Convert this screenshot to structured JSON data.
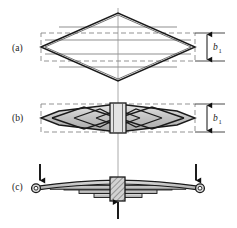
{
  "figure": {
    "width": 237,
    "height": 228,
    "background_color": "#ffffff",
    "stroke_color": "#1a1a1a",
    "cut_line_color": "#8a8a8a",
    "dashed_color": "#808080",
    "centerline_color": "#9a9a9a",
    "leaf_fill_color": "#c9c9c9",
    "clamp_fill_color": "#bdbdbd"
  },
  "panels": [
    {
      "id": "a",
      "label": "(a)",
      "label_x": 12,
      "label_y": 51,
      "description": "Diamond (lozenge) plate of maximum width b1 at the centre, divided by horizontal cut lines into strips",
      "dimension": {
        "symbol": "b",
        "subscript": "1",
        "label_x": 221,
        "label_y": 51
      },
      "diamond": {
        "center_x": 118,
        "center_y": 47,
        "half_length": 77,
        "half_height": 34
      },
      "cut_line_offsets": [
        -20,
        -7,
        7,
        20
      ],
      "dashed_box": {
        "x": 41,
        "y": 33,
        "width": 154,
        "height": 28
      }
    },
    {
      "id": "b",
      "label": "(b)",
      "label_x": 12,
      "label_y": 121,
      "description": "Strips rearranged symmetrically about the centre to form nested chevron leaves, held by a central clamp",
      "dimension": {
        "symbol": "b",
        "subscript": "1",
        "label_x": 221,
        "label_y": 121
      },
      "band": {
        "center_x": 118,
        "center_y": 118,
        "half_length": 77,
        "half_height": 14
      },
      "chevron_count": 3,
      "dashed_box": {
        "x": 41,
        "y": 104,
        "width": 154,
        "height": 28
      },
      "clamp": {
        "x": 110,
        "y": 104,
        "width": 16,
        "height": 29
      }
    },
    {
      "id": "c",
      "label": "(c)",
      "label_x": 12,
      "label_y": 188,
      "description": "Assembled semi-elliptic multi-leaf spring with rolled eyes at both ends, loaded at the eyes and supported at the centre clamp",
      "leaf_count": 5,
      "main_leaf": {
        "left_eye_x": 36,
        "right_eye_x": 200,
        "eye_y": 186,
        "eye_radius": 4.2
      },
      "clamp": {
        "x": 110,
        "y": 177,
        "width": 14,
        "height": 22
      },
      "loads": [
        {
          "name": "left-eye-load",
          "direction": "down",
          "x": 40,
          "y_start": 163,
          "y_end": 180
        },
        {
          "name": "right-eye-load",
          "direction": "down",
          "x": 196,
          "y_start": 163,
          "y_end": 180
        },
        {
          "name": "centre-reaction",
          "direction": "up",
          "x": 118,
          "y_start": 219,
          "y_end": 201
        }
      ]
    }
  ],
  "centerline": {
    "x": 118,
    "y_top": 8,
    "y_bottom": 214
  }
}
